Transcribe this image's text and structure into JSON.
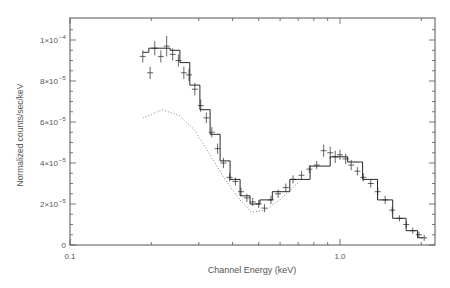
{
  "chart_data": {
    "type": "line",
    "title": "",
    "xlabel": "Channel Energy (keV)",
    "ylabel": "Normalized counts/sec/keV",
    "xscale": "log",
    "xlim": [
      0.1,
      2.3
    ],
    "ylim": [
      0,
      0.000108
    ],
    "x_ticks": [
      {
        "value": 0.1,
        "label": "0.1"
      },
      {
        "value": 1.0,
        "label": "1.0"
      }
    ],
    "x_minor_ticks": [
      0.2,
      0.3,
      0.4,
      0.5,
      0.6,
      0.7,
      0.8,
      0.9,
      2.0
    ],
    "y_ticks": [
      {
        "value": 0,
        "label": "0",
        "exp": ""
      },
      {
        "value": 2e-05,
        "label": "2×10",
        "exp": "−5"
      },
      {
        "value": 4e-05,
        "label": "4×10",
        "exp": "−5"
      },
      {
        "value": 6e-05,
        "label": "6×10",
        "exp": "−5"
      },
      {
        "value": 8e-05,
        "label": "8×10",
        "exp": "−5"
      },
      {
        "value": 0.0001,
        "label": "1×10",
        "exp": "−4"
      }
    ],
    "grid": false,
    "legend": null,
    "series": [
      {
        "name": "model (solid)",
        "style": "solid",
        "x": [
          0.186,
          0.206,
          0.225,
          0.245,
          0.266,
          0.29,
          0.316,
          0.345,
          0.375,
          0.409,
          0.445,
          0.484,
          0.527,
          0.598,
          0.71,
          0.846,
          1.0,
          1.14,
          1.29,
          1.47,
          1.67,
          1.85,
          2.03
        ],
        "y": [
          9.4e-05,
          9.6e-05,
          9.6e-05,
          9.5e-05,
          8.9e-05,
          7.8e-05,
          6.6e-05,
          5.4e-05,
          4.1e-05,
          3.2e-05,
          2.4e-05,
          2e-05,
          2.2e-05,
          2.6e-05,
          3.2e-05,
          3.85e-05,
          4.3e-05,
          4.05e-05,
          3.2e-05,
          2.2e-05,
          1.3e-05,
          7e-06,
          3.5e-06
        ]
      },
      {
        "name": "model component (dotted)",
        "style": "dotted",
        "x": [
          0.186,
          0.22,
          0.255,
          0.29,
          0.33,
          0.375,
          0.426,
          0.47,
          0.527,
          0.598,
          0.71
        ],
        "y": [
          6.2e-05,
          6.6e-05,
          6.3e-05,
          5.6e-05,
          4.4e-05,
          3.2e-05,
          2.2e-05,
          1.6e-05,
          1.7e-05,
          2.2e-05,
          3.1e-05
        ]
      },
      {
        "name": "data (crosses with error bars)",
        "style": "errorbar",
        "x": [
          0.186,
          0.198,
          0.206,
          0.217,
          0.228,
          0.24,
          0.252,
          0.264,
          0.276,
          0.29,
          0.305,
          0.32,
          0.335,
          0.352,
          0.37,
          0.39,
          0.41,
          0.43,
          0.452,
          0.475,
          0.5,
          0.525,
          0.555,
          0.59,
          0.63,
          0.67,
          0.72,
          0.77,
          0.82,
          0.87,
          0.92,
          0.96,
          1.0,
          1.05,
          1.1,
          1.16,
          1.22,
          1.3,
          1.38,
          1.47,
          1.56,
          1.66,
          1.76,
          1.86,
          1.96,
          2.05
        ],
        "y": [
          9.2e-05,
          8.4e-05,
          9.6e-05,
          9.2e-05,
          9.7e-05,
          9.3e-05,
          9e-05,
          8.4e-05,
          8.3e-05,
          7.6e-05,
          6.8e-05,
          6.2e-05,
          5.5e-05,
          4.7e-05,
          4e-05,
          3.3e-05,
          3.1e-05,
          2.6e-05,
          2.3e-05,
          2.1e-05,
          2e-05,
          1.8e-05,
          2.2e-05,
          2.5e-05,
          2.8e-05,
          3.2e-05,
          3.4e-05,
          3.7e-05,
          3.9e-05,
          4.6e-05,
          4.5e-05,
          4.3e-05,
          4.4e-05,
          4.2e-05,
          3.9e-05,
          3.6e-05,
          3.3e-05,
          3e-05,
          2.6e-05,
          2.2e-05,
          1.7e-05,
          1.3e-05,
          1e-05,
          7e-06,
          5e-06,
          3.5e-06
        ],
        "yerr": [
          3e-06,
          3e-06,
          3.5e-06,
          3e-06,
          5e-06,
          3e-06,
          3e-06,
          3e-06,
          3e-06,
          3e-06,
          3e-06,
          2.5e-06,
          2.5e-06,
          2.5e-06,
          2.5e-06,
          2e-06,
          2e-06,
          2e-06,
          2e-06,
          2e-06,
          2e-06,
          2e-06,
          2e-06,
          2e-06,
          2e-06,
          2e-06,
          2e-06,
          2e-06,
          2e-06,
          3e-06,
          3e-06,
          3e-06,
          2.5e-06,
          2.5e-06,
          2.5e-06,
          2e-06,
          2e-06,
          2e-06,
          2e-06,
          2e-06,
          1.5e-06,
          1.5e-06,
          1.5e-06,
          1e-06,
          1e-06,
          1e-06
        ]
      }
    ]
  },
  "colors": {
    "axis": "#555555",
    "data": "#222222",
    "model": "#111111",
    "component": "#666666",
    "background": "#ffffff"
  }
}
